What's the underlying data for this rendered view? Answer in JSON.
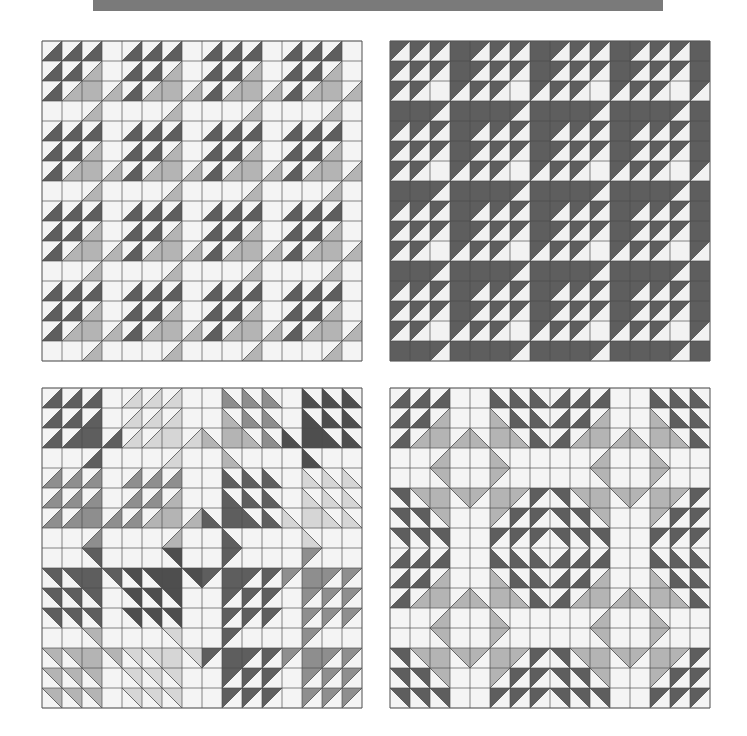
{
  "banner": {
    "color": "#7a7a7a"
  },
  "grid": {
    "cells": 16,
    "block_size": 4,
    "cell_px": 20,
    "line_color": "#4a4a4a",
    "border_color": "#555555"
  },
  "palette": {
    "white": "#f4f4f4",
    "dark": "#5e5e5e",
    "darker": "#4e4e4e",
    "medium": "#8e8e8e",
    "gray": "#b4b4b4",
    "light": "#d6d6d6",
    "inverse_light": "#f2f2f2"
  },
  "base_block": [
    [
      [
        "H",
        "d"
      ],
      [
        "H",
        "d"
      ],
      [
        "H",
        "d"
      ],
      [
        "W",
        ""
      ]
    ],
    [
      [
        "H",
        "d"
      ],
      [
        "H",
        "d"
      ],
      [
        "H",
        "g"
      ],
      [
        "W",
        ""
      ]
    ],
    [
      [
        "H",
        "d"
      ],
      [
        "H",
        "g"
      ],
      [
        "F",
        "g"
      ],
      [
        "H",
        "g"
      ]
    ],
    [
      [
        "W",
        ""
      ],
      [
        "W",
        ""
      ],
      [
        "H",
        "g"
      ],
      [
        "W",
        ""
      ]
    ]
  ],
  "panels": [
    {
      "id": "panel-tl",
      "name": "quilt-panel-top-left",
      "background": "white",
      "blocks": [
        [
          {
            "fx": 0,
            "fy": 0,
            "d": "dark",
            "g": "gray"
          },
          {
            "fx": 0,
            "fy": 0,
            "d": "dark",
            "g": "gray"
          },
          {
            "fx": 0,
            "fy": 0,
            "d": "dark",
            "g": "gray"
          },
          {
            "fx": 0,
            "fy": 0,
            "d": "dark",
            "g": "gray"
          }
        ],
        [
          {
            "fx": 0,
            "fy": 0,
            "d": "dark",
            "g": "gray"
          },
          {
            "fx": 0,
            "fy": 0,
            "d": "dark",
            "g": "gray"
          },
          {
            "fx": 0,
            "fy": 0,
            "d": "dark",
            "g": "gray"
          },
          {
            "fx": 0,
            "fy": 0,
            "d": "dark",
            "g": "gray"
          }
        ],
        [
          {
            "fx": 0,
            "fy": 0,
            "d": "dark",
            "g": "gray"
          },
          {
            "fx": 0,
            "fy": 0,
            "d": "dark",
            "g": "gray"
          },
          {
            "fx": 0,
            "fy": 0,
            "d": "dark",
            "g": "gray"
          },
          {
            "fx": 0,
            "fy": 0,
            "d": "dark",
            "g": "gray"
          }
        ],
        [
          {
            "fx": 0,
            "fy": 0,
            "d": "dark",
            "g": "gray"
          },
          {
            "fx": 0,
            "fy": 0,
            "d": "dark",
            "g": "gray"
          },
          {
            "fx": 0,
            "fy": 0,
            "d": "dark",
            "g": "gray"
          },
          {
            "fx": 0,
            "fy": 0,
            "d": "dark",
            "g": "gray"
          }
        ]
      ]
    },
    {
      "id": "panel-tr",
      "name": "quilt-panel-top-right",
      "background": "dark",
      "blocks": [
        [
          {
            "fx": 0,
            "fy": 0,
            "d": "inverse_light",
            "g": "inverse_light"
          },
          {
            "fx": 0,
            "fy": 0,
            "d": "inverse_light",
            "g": "inverse_light"
          },
          {
            "fx": 0,
            "fy": 0,
            "d": "inverse_light",
            "g": "inverse_light"
          },
          {
            "fx": 0,
            "fy": 0,
            "d": "inverse_light",
            "g": "inverse_light"
          }
        ],
        [
          {
            "fx": 0,
            "fy": 0,
            "d": "inverse_light",
            "g": "inverse_light"
          },
          {
            "fx": 0,
            "fy": 0,
            "d": "inverse_light",
            "g": "inverse_light"
          },
          {
            "fx": 0,
            "fy": 0,
            "d": "inverse_light",
            "g": "inverse_light"
          },
          {
            "fx": 0,
            "fy": 0,
            "d": "inverse_light",
            "g": "inverse_light"
          }
        ],
        [
          {
            "fx": 0,
            "fy": 0,
            "d": "inverse_light",
            "g": "inverse_light"
          },
          {
            "fx": 0,
            "fy": 0,
            "d": "inverse_light",
            "g": "inverse_light"
          },
          {
            "fx": 0,
            "fy": 0,
            "d": "inverse_light",
            "g": "inverse_light"
          },
          {
            "fx": 0,
            "fy": 0,
            "d": "inverse_light",
            "g": "inverse_light"
          }
        ],
        [
          {
            "fx": 0,
            "fy": 0,
            "d": "inverse_light",
            "g": "inverse_light"
          },
          {
            "fx": 0,
            "fy": 0,
            "d": "inverse_light",
            "g": "inverse_light"
          },
          {
            "fx": 0,
            "fy": 0,
            "d": "inverse_light",
            "g": "inverse_light"
          },
          {
            "fx": 0,
            "fy": 0,
            "d": "inverse_light",
            "g": "inverse_light"
          }
        ]
      ]
    },
    {
      "id": "panel-bl",
      "name": "quilt-panel-bottom-left",
      "background": "white",
      "blocks": [
        [
          {
            "fx": 0,
            "fy": 0,
            "d": "dark",
            "g": "dark"
          },
          {
            "fx": 0,
            "fy": 0,
            "d": "light",
            "g": "light"
          },
          {
            "fx": 1,
            "fy": 0,
            "d": "medium",
            "g": "gray"
          },
          {
            "fx": 1,
            "fy": 0,
            "d": "darker",
            "g": "darker"
          }
        ],
        [
          {
            "fx": 0,
            "fy": 0,
            "d": "medium",
            "g": "medium"
          },
          {
            "fx": 0,
            "fy": 0,
            "d": "medium",
            "g": "gray"
          },
          {
            "fx": 1,
            "fy": 0,
            "d": "dark",
            "g": "dark"
          },
          {
            "fx": 1,
            "fy": 0,
            "d": "light",
            "g": "light"
          }
        ],
        [
          {
            "fx": 0,
            "fy": 1,
            "d": "dark",
            "g": "dark"
          },
          {
            "fx": 0,
            "fy": 1,
            "d": "darker",
            "g": "darker"
          },
          {
            "fx": 1,
            "fy": 1,
            "d": "dark",
            "g": "dark"
          },
          {
            "fx": 1,
            "fy": 1,
            "d": "medium",
            "g": "medium"
          }
        ],
        [
          {
            "fx": 0,
            "fy": 1,
            "d": "gray",
            "g": "gray"
          },
          {
            "fx": 0,
            "fy": 1,
            "d": "light",
            "g": "light"
          },
          {
            "fx": 1,
            "fy": 1,
            "d": "dark",
            "g": "dark"
          },
          {
            "fx": 1,
            "fy": 1,
            "d": "medium",
            "g": "medium"
          }
        ]
      ]
    },
    {
      "id": "panel-br",
      "name": "quilt-panel-bottom-right",
      "background": "white",
      "blocks": [
        [
          {
            "fx": 0,
            "fy": 0,
            "d": "dark",
            "g": "gray"
          },
          {
            "fx": 1,
            "fy": 0,
            "d": "dark",
            "g": "gray"
          },
          {
            "fx": 0,
            "fy": 0,
            "d": "dark",
            "g": "gray"
          },
          {
            "fx": 1,
            "fy": 0,
            "d": "dark",
            "g": "gray"
          }
        ],
        [
          {
            "fx": 0,
            "fy": 1,
            "d": "dark",
            "g": "gray"
          },
          {
            "fx": 1,
            "fy": 1,
            "d": "dark",
            "g": "gray"
          },
          {
            "fx": 0,
            "fy": 1,
            "d": "dark",
            "g": "gray"
          },
          {
            "fx": 1,
            "fy": 1,
            "d": "dark",
            "g": "gray"
          }
        ],
        [
          {
            "fx": 0,
            "fy": 0,
            "d": "dark",
            "g": "gray"
          },
          {
            "fx": 1,
            "fy": 0,
            "d": "dark",
            "g": "gray"
          },
          {
            "fx": 0,
            "fy": 0,
            "d": "dark",
            "g": "gray"
          },
          {
            "fx": 1,
            "fy": 0,
            "d": "dark",
            "g": "gray"
          }
        ],
        [
          {
            "fx": 0,
            "fy": 1,
            "d": "dark",
            "g": "gray"
          },
          {
            "fx": 1,
            "fy": 1,
            "d": "dark",
            "g": "gray"
          },
          {
            "fx": 0,
            "fy": 1,
            "d": "dark",
            "g": "gray"
          },
          {
            "fx": 1,
            "fy": 1,
            "d": "dark",
            "g": "gray"
          }
        ]
      ]
    }
  ]
}
